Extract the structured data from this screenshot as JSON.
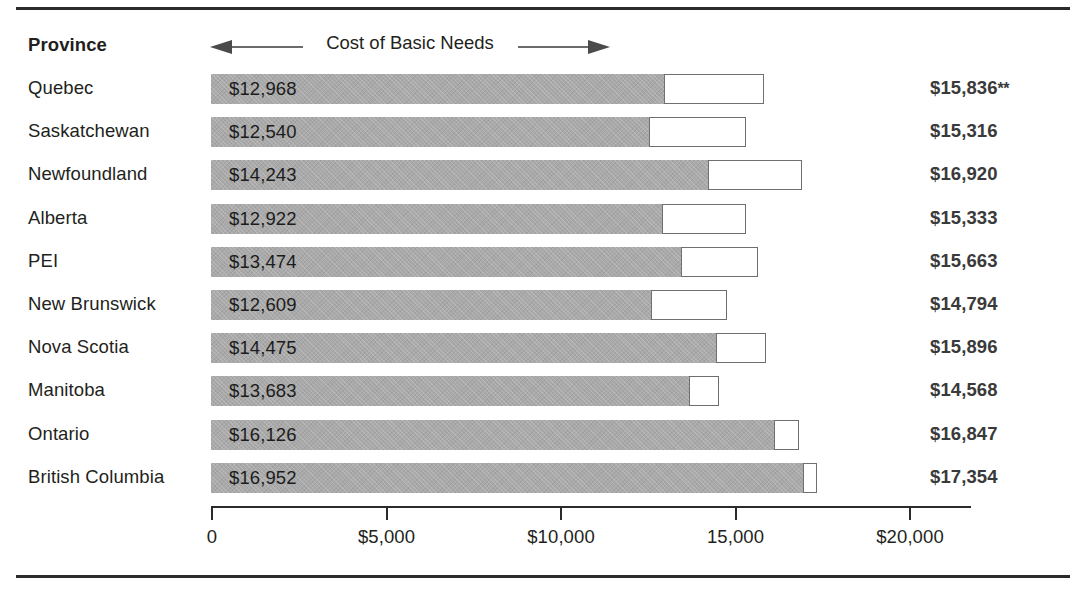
{
  "figure": {
    "column_header": "Province",
    "axis_arrow_label": "Cost of Basic Needs"
  },
  "chart_data": {
    "type": "bar",
    "title": "Cost of Basic Needs",
    "orientation": "horizontal",
    "stacked": true,
    "xlabel": "",
    "ylabel": "Province",
    "xlim": [
      0,
      20000
    ],
    "grid": false,
    "legend": "none",
    "axis_ticks": [
      {
        "value": 0,
        "label": "0"
      },
      {
        "value": 5000,
        "label": "$5,000"
      },
      {
        "value": 10000,
        "label": "$10,000"
      },
      {
        "value": 15000,
        "label": "15,000"
      },
      {
        "value": 20000,
        "label": "$20,000"
      }
    ],
    "categories": [
      "Quebec",
      "Saskatchewan",
      "Newfoundland",
      "Alberta",
      "PEI",
      "New Brunswick",
      "Nova Scotia",
      "Manitoba",
      "Ontario",
      "British Columbia"
    ],
    "series": [
      {
        "name": "Cost of Basic Needs",
        "color": "#a9a9a9",
        "values": [
          12968,
          12540,
          14243,
          12922,
          13474,
          12609,
          14475,
          13683,
          16126,
          16952
        ]
      },
      {
        "name": "Remainder to total",
        "color": "#ffffff",
        "values": [
          2868,
          2776,
          2677,
          2411,
          2189,
          2185,
          1421,
          885,
          721,
          402
        ]
      }
    ],
    "rows": [
      {
        "province": "Quebec",
        "bar_label": "$12,968",
        "basic_needs": 12968,
        "total_label": "$15,836",
        "total": 15836,
        "footnote_marker": "**"
      },
      {
        "province": "Saskatchewan",
        "bar_label": "$12,540",
        "basic_needs": 12540,
        "total_label": "$15,316",
        "total": 15316,
        "footnote_marker": ""
      },
      {
        "province": "Newfoundland",
        "bar_label": "$14,243",
        "basic_needs": 14243,
        "total_label": "$16,920",
        "total": 16920,
        "footnote_marker": ""
      },
      {
        "province": "Alberta",
        "bar_label": "$12,922",
        "basic_needs": 12922,
        "total_label": "$15,333",
        "total": 15333,
        "footnote_marker": ""
      },
      {
        "province": "PEI",
        "bar_label": "$13,474",
        "basic_needs": 13474,
        "total_label": "$15,663",
        "total": 15663,
        "footnote_marker": ""
      },
      {
        "province": "New Brunswick",
        "bar_label": "$12,609",
        "basic_needs": 12609,
        "total_label": "$14,794",
        "total": 14794,
        "footnote_marker": ""
      },
      {
        "province": "Nova Scotia",
        "bar_label": "$14,475",
        "basic_needs": 14475,
        "total_label": "$15,896",
        "total": 15896,
        "footnote_marker": ""
      },
      {
        "province": "Manitoba",
        "bar_label": "$13,683",
        "basic_needs": 13683,
        "total_label": "$14,568",
        "total": 14568,
        "footnote_marker": ""
      },
      {
        "province": "Ontario",
        "bar_label": "$16,126",
        "basic_needs": 16126,
        "total_label": "$16,847",
        "total": 16847,
        "footnote_marker": ""
      },
      {
        "province": "British Columbia",
        "bar_label": "$16,952",
        "basic_needs": 16952,
        "total_label": "$17,354",
        "total": 17354,
        "footnote_marker": ""
      }
    ]
  },
  "layout": {
    "axis_origin_x": 211,
    "px_per_unit": 0.0349,
    "row_top": 74,
    "row_pitch": 43.2,
    "bar_height": 30
  }
}
